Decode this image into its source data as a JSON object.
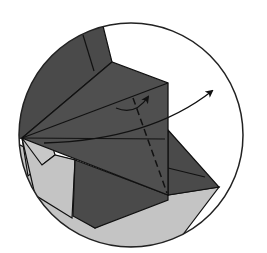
{
  "diagram": {
    "type": "origami-fold-detail",
    "colors": {
      "background": "#ffffff",
      "dark_paper": "#4a4a4a",
      "light_paper": "#c4c4c4",
      "line": "#111111",
      "circle_outline": "#222222"
    },
    "circle": {
      "cx": 131,
      "cy": 135,
      "r": 112
    },
    "symbols": {
      "valley_fold_line": "dashed",
      "fold_arrow": "curved arrow swinging flap to the right",
      "rotation_arrow": "small curved arrow indicating rotation near top of flap"
    }
  }
}
